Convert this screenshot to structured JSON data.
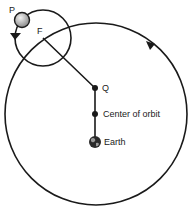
{
  "diagram": {
    "type": "ptolemaic-epicycle-model",
    "labels": {
      "planet": "P",
      "epicycle_center": "F",
      "equant": "Q",
      "center": "Center of orbit",
      "earth": "Earth"
    },
    "colors": {
      "line": "#1a1a1a",
      "planet_fill": "#bdbdbd",
      "earth_fill": "#2a2a2a",
      "background": "#ffffff"
    },
    "deferent": {
      "cx": 96,
      "cy": 114,
      "r": 91,
      "direction": "counterclockwise"
    },
    "epicycle": {
      "cx": 43,
      "cy": 38,
      "r": 28,
      "direction": "counterclockwise"
    },
    "points": {
      "P": {
        "x": 22,
        "y": 20
      },
      "F": {
        "x": 43,
        "y": 38
      },
      "Q": {
        "x": 95,
        "y": 88
      },
      "center": {
        "x": 95,
        "y": 114
      },
      "earth": {
        "x": 95,
        "y": 142
      }
    }
  }
}
